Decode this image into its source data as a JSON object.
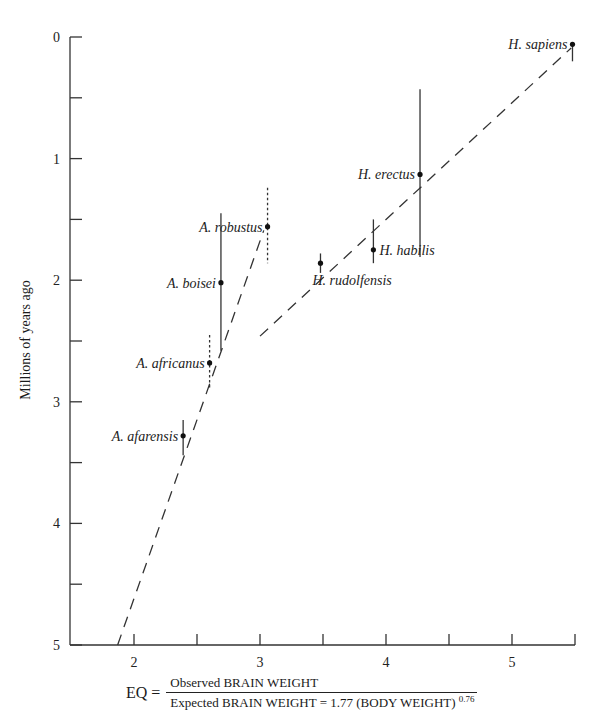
{
  "chart_data": {
    "type": "scatter",
    "title": "",
    "xlabel": "EQ = Observed BRAIN WEIGHT / Expected BRAIN WEIGHT = 1.77 (BODY WEIGHT)^0.76",
    "ylabel": "Millions of years ago",
    "xlim": [
      1.7,
      5.5
    ],
    "ylim": [
      5,
      0
    ],
    "y_inverted": true,
    "grid": false,
    "legend": null,
    "x_ticks": [
      2,
      2.5,
      3,
      3.5,
      4,
      4.5,
      5,
      5.5
    ],
    "x_tick_labels": [
      "2",
      "",
      "3",
      "",
      "4",
      "",
      "5",
      ""
    ],
    "y_ticks": [
      0,
      0.5,
      1,
      1.5,
      2,
      2.5,
      3,
      3.5,
      4,
      4.5,
      5
    ],
    "y_tick_labels": [
      "0",
      "",
      "1",
      "",
      "2",
      "",
      "3",
      "",
      "4",
      "",
      "5"
    ],
    "points": [
      {
        "label": "H. sapiens",
        "eq": 5.48,
        "mya": 0.06,
        "range": [
          0.06,
          0.2
        ],
        "range_style": "solid",
        "label_side": "left"
      },
      {
        "label": "H. erectus",
        "eq": 4.27,
        "mya": 1.13,
        "range": [
          0.43,
          1.81
        ],
        "range_style": "solid",
        "label_side": "left"
      },
      {
        "label": "H. habilis",
        "eq": 3.9,
        "mya": 1.75,
        "range": [
          1.5,
          1.86
        ],
        "range_style": "solid",
        "label_side": "right"
      },
      {
        "label": "H. rudolfensis",
        "eq": 3.48,
        "mya": 1.86,
        "range": [
          1.78,
          1.94
        ],
        "range_style": "solid",
        "label_side": "below-right"
      },
      {
        "label": "A. robustus",
        "eq": 3.06,
        "mya": 1.56,
        "range": [
          1.24,
          1.86
        ],
        "range_style": "dotted",
        "label_side": "left"
      },
      {
        "label": "A. boisei",
        "eq": 2.69,
        "mya": 2.02,
        "range": [
          1.45,
          2.58
        ],
        "range_style": "solid",
        "label_side": "left"
      },
      {
        "label": "A. africanus",
        "eq": 2.6,
        "mya": 2.68,
        "range": [
          2.45,
          2.9
        ],
        "range_style": "dotted",
        "label_side": "left"
      },
      {
        "label": "A. afarensis",
        "eq": 2.39,
        "mya": 3.28,
        "range": [
          3.15,
          3.44
        ],
        "range_style": "solid",
        "label_side": "left"
      }
    ],
    "trend_lines": [
      {
        "name": "Australopithecus trend",
        "style": "dashed",
        "from": {
          "eq": 1.87,
          "mya": 5.0
        },
        "to": {
          "eq": 3.03,
          "mya": 1.59
        }
      },
      {
        "name": "Homo trend",
        "style": "dashed",
        "from": {
          "eq": 3.0,
          "mya": 2.46
        },
        "to": {
          "eq": 5.47,
          "mya": 0.09
        }
      }
    ]
  },
  "axes": {
    "ylabel": "Millions of years ago",
    "formula": {
      "lhs": "EQ =",
      "numerator": "Observed BRAIN WEIGHT",
      "denominator": "Expected BRAIN WEIGHT = 1.77 (BODY WEIGHT)",
      "exponent": "0.76"
    }
  }
}
